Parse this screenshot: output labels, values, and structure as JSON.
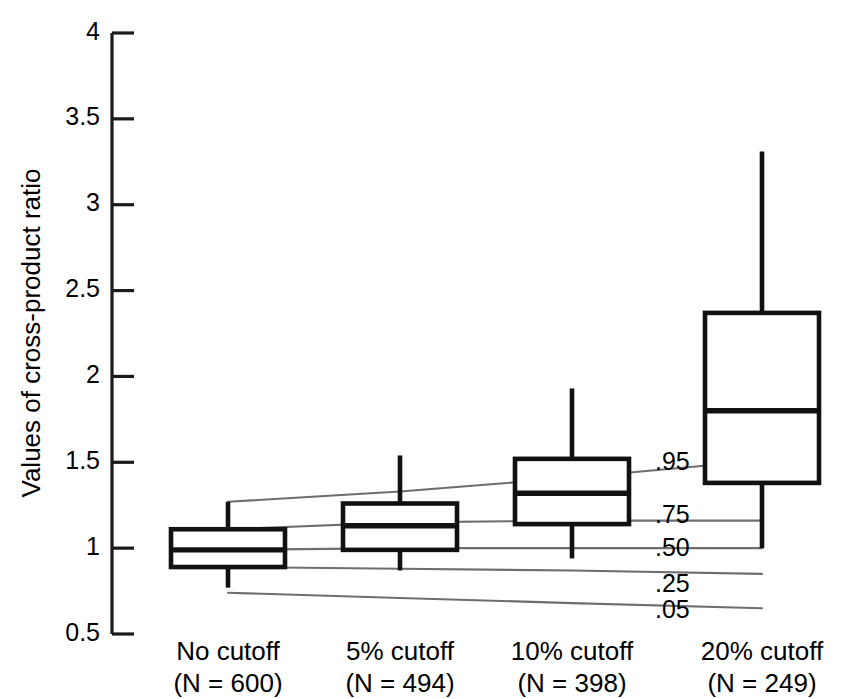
{
  "chart_data": {
    "type": "box",
    "title": "",
    "xlabel": "",
    "ylabel": "Values of cross-product ratio",
    "ylim": [
      0.5,
      4
    ],
    "yticks": [
      0.5,
      1,
      1.5,
      2,
      2.5,
      3,
      3.5,
      4
    ],
    "ytick_labels": [
      "0.5",
      "1",
      "1.5",
      "2",
      "2.5",
      "3",
      "3.5",
      "4"
    ],
    "grid": false,
    "legend_position": "none",
    "categories": [
      "No cutoff\n(N = 600)",
      "5% cutoff\n(N = 494)",
      "10% cutoff\n(N = 398)",
      "20% cutoff\n(N = 249)"
    ],
    "category_lines": [
      [
        "No cutoff",
        "(N = 600)"
      ],
      [
        "5% cutoff",
        "(N = 494)"
      ],
      [
        "10% cutoff",
        "(N = 398)"
      ],
      [
        "20% cutoff",
        "(N = 249)"
      ]
    ],
    "sample_sizes": [
      600,
      494,
      398,
      249
    ],
    "boxes": [
      {
        "category": "No cutoff",
        "n": 600,
        "whisker_low": 0.77,
        "q1": 0.89,
        "median": 0.99,
        "q3": 1.11,
        "whisker_high": 1.27
      },
      {
        "category": "5% cutoff",
        "n": 494,
        "whisker_low": 0.87,
        "q1": 0.99,
        "median": 1.13,
        "q3": 1.26,
        "whisker_high": 1.54
      },
      {
        "category": "10% cutoff",
        "n": 398,
        "whisker_low": 0.94,
        "q1": 1.14,
        "median": 1.32,
        "q3": 1.52,
        "whisker_high": 1.93
      },
      {
        "category": "20% cutoff",
        "n": 249,
        "whisker_low": 1.0,
        "q1": 1.38,
        "median": 1.8,
        "q3": 2.37,
        "whisker_high": 3.31
      }
    ],
    "percentile_curves": [
      {
        "label": ".95",
        "values": [
          1.27,
          1.33,
          1.41,
          1.51
        ]
      },
      {
        "label": ".75",
        "values": [
          1.11,
          1.15,
          1.16,
          1.16
        ]
      },
      {
        "label": ".50",
        "values": [
          0.99,
          1.0,
          1.0,
          1.0
        ]
      },
      {
        "label": ".25",
        "values": [
          0.89,
          0.88,
          0.87,
          0.85
        ]
      },
      {
        "label": ".05",
        "values": [
          0.74,
          0.71,
          0.68,
          0.65
        ]
      }
    ],
    "colors": {
      "box_stroke": "#111111",
      "curve_stroke": "#6e6e6e",
      "axis": "#1a1a1a",
      "background": "#ffffff"
    }
  }
}
